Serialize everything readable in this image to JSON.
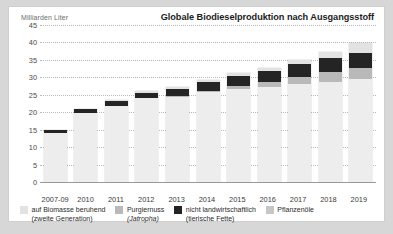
{
  "header": {
    "unit_label": "Milliarden Liter",
    "title": "Globale Biodieselproduktion nach Ausgangsstoff"
  },
  "colors": {
    "pflanzenoele": "#ededed",
    "nicht_landwirtschaftlich": "#242424",
    "purgiernuss": "#b9b9b9",
    "biomasse": "#e2e2e2",
    "grid": "#b9b9b9",
    "axis": "#9a9a9a",
    "text": "#2a2a2a",
    "panel": "#ffffff",
    "page": "#d7d7d7"
  },
  "legend": {
    "items": [
      {
        "key": "biomasse",
        "swatch": "#e2e2e2",
        "line1": "auf Biomasse beruhend",
        "line2": "(zweite Generation)",
        "line2_italic": false
      },
      {
        "key": "purgiernuss",
        "swatch": "#b9b9b9",
        "line1": "Purgiernuss",
        "line2": "(Jatropha)",
        "line2_italic": true
      },
      {
        "key": "nicht_landwirtschaftlich",
        "swatch": "#242424",
        "line1": "nicht landwirtschaftlich",
        "line2": "(tierische Fette)",
        "line2_italic": false
      },
      {
        "key": "pflanzenoele",
        "swatch": "#c6c6c6",
        "line1": "Pflanzenöle",
        "line2": "",
        "line2_italic": false
      }
    ]
  },
  "chart_data": {
    "type": "bar",
    "stacked": true,
    "title": "Globale Biodieselproduktion nach Ausgangsstoff",
    "xlabel": "",
    "ylabel": "Milliarden Liter",
    "ylim": [
      0,
      45
    ],
    "yticks": [
      0,
      5,
      10,
      15,
      20,
      25,
      30,
      35,
      40,
      45
    ],
    "ytick_labels": [
      "0",
      "5",
      "10",
      "15",
      "20",
      "25",
      "30",
      "35",
      "40",
      "45"
    ],
    "grid": true,
    "legend_position": "bottom",
    "categories": [
      "2007-09",
      "2010",
      "2011",
      "2012",
      "2013",
      "2014",
      "2015",
      "2016",
      "2017",
      "2018",
      "2019"
    ],
    "series": [
      {
        "name": "Pflanzenöle",
        "color": "#ededed",
        "values": [
          14.0,
          19.8,
          21.9,
          24.0,
          24.5,
          25.7,
          26.6,
          27.2,
          28.0,
          28.8,
          29.5
        ]
      },
      {
        "name": "Purgiernuss (Jatropha)",
        "color": "#b9b9b9",
        "values": [
          0.0,
          0.0,
          0.0,
          0.0,
          0.2,
          0.5,
          1.0,
          1.5,
          2.2,
          2.7,
          3.3
        ]
      },
      {
        "name": "nicht landwirtschaftlich (tierische Fette)",
        "color": "#242424",
        "values": [
          0.9,
          1.0,
          1.3,
          1.6,
          2.0,
          2.4,
          2.9,
          3.2,
          3.6,
          4.0,
          4.3
        ]
      },
      {
        "name": "auf Biomasse beruhend (zweite Generation)",
        "color": "#e2e2e2",
        "values": [
          0.1,
          0.2,
          0.3,
          0.4,
          0.5,
          0.6,
          0.7,
          0.9,
          1.2,
          1.8,
          2.7
        ]
      }
    ],
    "totals": [
      15.0,
      21.0,
      23.5,
      26.0,
      27.2,
      29.2,
      31.2,
      32.8,
      35.0,
      37.3,
      39.8
    ]
  }
}
